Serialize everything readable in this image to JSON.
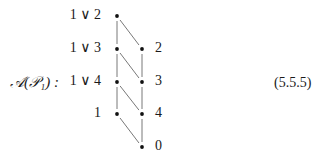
{
  "equation": {
    "name": "𝒜(𝒫₁) :",
    "number": "(5.5.5)"
  },
  "diagram": {
    "nodes": [
      {
        "id": "1v2",
        "label": "1 ∨ 2",
        "side": "left",
        "row": 0,
        "col": 0
      },
      {
        "id": "1v3",
        "label": "1 ∨ 3",
        "side": "left",
        "row": 1,
        "col": 0
      },
      {
        "id": "2",
        "label": "2",
        "side": "right",
        "row": 1,
        "col": 1
      },
      {
        "id": "1v4",
        "label": "1 ∨ 4",
        "side": "left",
        "row": 2,
        "col": 0
      },
      {
        "id": "3",
        "label": "3",
        "side": "right",
        "row": 2,
        "col": 1
      },
      {
        "id": "1",
        "label": "1",
        "side": "left",
        "row": 3,
        "col": 0
      },
      {
        "id": "4",
        "label": "4",
        "side": "right",
        "row": 3,
        "col": 1
      },
      {
        "id": "0",
        "label": "0",
        "side": "right",
        "row": 4,
        "col": 1
      }
    ],
    "edges": [
      [
        "1v2",
        "1v3"
      ],
      [
        "1v2",
        "2"
      ],
      [
        "1v3",
        "1v4"
      ],
      [
        "1v3",
        "3"
      ],
      [
        "2",
        "3"
      ],
      [
        "1v4",
        "1"
      ],
      [
        "1v4",
        "4"
      ],
      [
        "3",
        "4"
      ],
      [
        "1",
        "0"
      ],
      [
        "4",
        "0"
      ]
    ]
  }
}
